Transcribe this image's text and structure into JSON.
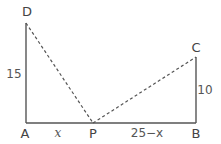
{
  "diagram": {
    "points": {
      "A": {
        "label": "A",
        "x": 26,
        "y": 123
      },
      "B": {
        "label": "B",
        "x": 196,
        "y": 123
      },
      "C": {
        "label": "C",
        "x": 196,
        "y": 57
      },
      "D": {
        "label": "D",
        "x": 26,
        "y": 23
      },
      "P": {
        "label": "P",
        "x": 93,
        "y": 123
      }
    },
    "lengths": {
      "AD": "15",
      "BC": "10",
      "AP": "x",
      "PB": "25−x"
    },
    "colors": {
      "solid": "#555555",
      "dashed": "#555555",
      "text": "#444444"
    }
  }
}
